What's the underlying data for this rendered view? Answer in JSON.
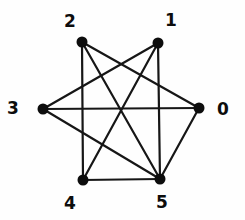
{
  "figure": {
    "type": "graph",
    "background": "#fefefe",
    "node_color": "#0d0d0d",
    "edge_color": "#161616",
    "label_color": "#0d0d0d",
    "node_radius": 5.5,
    "edge_width": 2.2,
    "nodes": [
      {
        "id": "0",
        "label": "0",
        "x": 199,
        "y": 108,
        "label_x": 223,
        "label_y": 109
      },
      {
        "id": "1",
        "label": "1",
        "x": 158,
        "y": 43,
        "label_x": 171,
        "label_y": 20
      },
      {
        "id": "2",
        "label": "2",
        "x": 82,
        "y": 42,
        "label_x": 70,
        "label_y": 21
      },
      {
        "id": "3",
        "label": "3",
        "x": 43,
        "y": 109,
        "label_x": 13,
        "label_y": 108
      },
      {
        "id": "4",
        "label": "4",
        "x": 83,
        "y": 180,
        "label_x": 70,
        "label_y": 203
      },
      {
        "id": "5",
        "label": "5",
        "x": 160,
        "y": 179,
        "label_x": 162,
        "label_y": 202
      }
    ],
    "edges": [
      [
        "0",
        "2"
      ],
      [
        "0",
        "3"
      ],
      [
        "0",
        "5"
      ],
      [
        "1",
        "3"
      ],
      [
        "1",
        "4"
      ],
      [
        "1",
        "5"
      ],
      [
        "2",
        "4"
      ],
      [
        "2",
        "5"
      ],
      [
        "3",
        "5"
      ],
      [
        "4",
        "5"
      ]
    ]
  }
}
